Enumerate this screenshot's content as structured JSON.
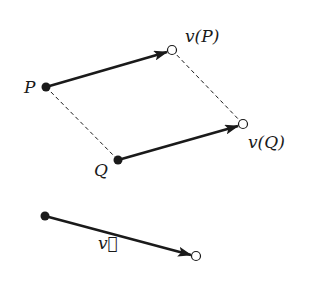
{
  "diagram": {
    "points": {
      "P": {
        "x": 46,
        "y": 87,
        "label": "P",
        "filled": true
      },
      "vP": {
        "x": 172,
        "y": 50,
        "label": "v(P)",
        "filled": false
      },
      "Q": {
        "x": 118,
        "y": 160,
        "label": "Q",
        "filled": true
      },
      "vQ": {
        "x": 243,
        "y": 124,
        "label": "v(Q)",
        "filled": false
      },
      "v_start": {
        "x": 45,
        "y": 216,
        "filled": true
      },
      "v_end": {
        "x": 196,
        "y": 256,
        "filled": false
      }
    },
    "arrows": [
      {
        "from": "P",
        "to": "vP"
      },
      {
        "from": "Q",
        "to": "vQ"
      },
      {
        "from": "v_start",
        "to": "v_end",
        "label": "v⃗"
      }
    ],
    "dashed_lines": [
      {
        "from": "P",
        "to": "Q"
      },
      {
        "from": "vP",
        "to": "vQ"
      }
    ],
    "labels": {
      "P": "P",
      "vP": "v(P)",
      "Q": "Q",
      "vQ": "v(Q)",
      "vec": "v⃗"
    },
    "colors": {
      "stroke": "#1a1a1a",
      "background": "#ffffff"
    }
  }
}
